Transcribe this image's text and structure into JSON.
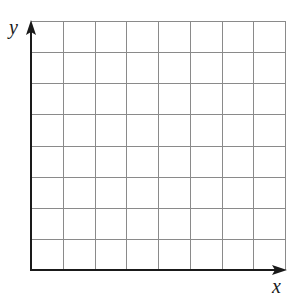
{
  "diagram": {
    "type": "blank-coordinate-grid",
    "axes": {
      "x_label": "x",
      "y_label": "y"
    },
    "grid": {
      "columns": 8,
      "rows": 8,
      "origin_px": [
        31,
        270
      ],
      "top_right_px": [
        285,
        21
      ],
      "line_color": "#8a8a8a",
      "axis_color": "#1a1a1a"
    }
  }
}
